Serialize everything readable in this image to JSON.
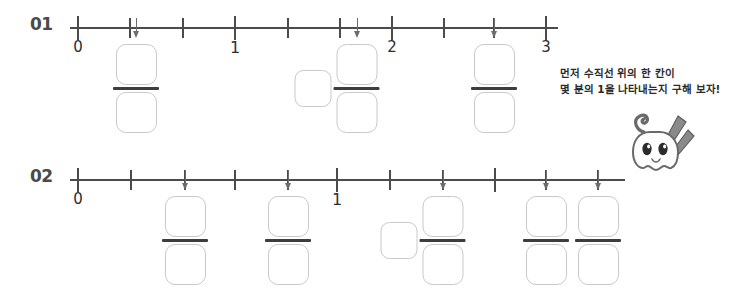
{
  "page": {
    "background": "#ffffff",
    "axis_color": "#4b4b4b",
    "arrow_color": "#6d6d6d",
    "box_border_color": "#c9c9c9",
    "fraction_bar_color": "#3d3d3d"
  },
  "problems": [
    {
      "number": "01",
      "axis": {
        "ticks": [
          {
            "x": 78,
            "major": true,
            "label": "0"
          },
          {
            "x": 130,
            "major": false,
            "label": ""
          },
          {
            "x": 183,
            "major": false,
            "label": ""
          },
          {
            "x": 235,
            "major": true,
            "label": "1"
          },
          {
            "x": 288,
            "major": false,
            "label": ""
          },
          {
            "x": 340,
            "major": false,
            "label": ""
          },
          {
            "x": 392,
            "major": true,
            "label": "2"
          },
          {
            "x": 444,
            "major": false,
            "label": ""
          },
          {
            "x": 494,
            "major": false,
            "label": ""
          },
          {
            "x": 546,
            "major": true,
            "label": "3"
          }
        ],
        "line_start": 70,
        "line_end": 558
      },
      "markers": [
        {
          "x": 136,
          "type": "fraction"
        },
        {
          "x": 357,
          "type": "mixed"
        },
        {
          "x": 494,
          "type": "fraction"
        }
      ]
    },
    {
      "number": "02",
      "axis": {
        "ticks": [
          {
            "x": 78,
            "major": true,
            "label": "0"
          },
          {
            "x": 131,
            "major": false,
            "label": ""
          },
          {
            "x": 185,
            "major": false,
            "label": ""
          },
          {
            "x": 235,
            "major": false,
            "label": ""
          },
          {
            "x": 288,
            "major": false,
            "label": ""
          },
          {
            "x": 337,
            "major": true,
            "label": "1"
          },
          {
            "x": 390,
            "major": false,
            "label": ""
          },
          {
            "x": 443,
            "major": false,
            "label": ""
          },
          {
            "x": 495,
            "major": true,
            "label": ""
          },
          {
            "x": 546,
            "major": false,
            "label": ""
          },
          {
            "x": 598,
            "major": false,
            "label": ""
          }
        ],
        "line_start": 70,
        "line_end": 625
      },
      "markers": [
        {
          "x": 185,
          "type": "fraction"
        },
        {
          "x": 288,
          "type": "fraction"
        },
        {
          "x": 443,
          "type": "mixed"
        },
        {
          "x": 546,
          "type": "fraction"
        },
        {
          "x": 598,
          "type": "fraction"
        }
      ]
    }
  ],
  "hint": {
    "line1": "먼저 수직선 위의 한 칸이",
    "line2": "몇 분의 1을 나타내는지 구해 보자!"
  },
  "mascot": {
    "name": "ghost-mascot-with-pencils"
  }
}
